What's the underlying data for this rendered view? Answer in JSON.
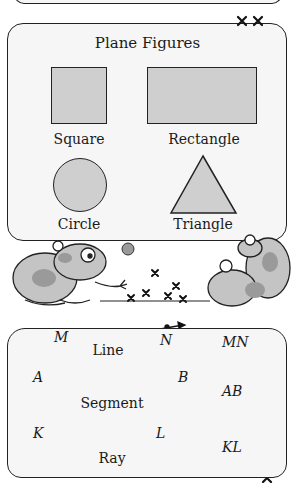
{
  "panel_top": {
    "title": "Plane Figures",
    "figures": [
      {
        "name": "square",
        "label": "Square"
      },
      {
        "name": "rectangle",
        "label": "Rectangle"
      },
      {
        "name": "circle",
        "label": "Circle"
      },
      {
        "name": "triangle",
        "label": "Triangle"
      }
    ]
  },
  "panel_bottom": {
    "rows": [
      {
        "kind": "line",
        "label": "Line",
        "point1": "M",
        "point2": "N",
        "notation": "MN",
        "symbol": "double-arrow"
      },
      {
        "kind": "segment",
        "label": "Segment",
        "point1": "A",
        "point2": "B",
        "notation": "AB",
        "symbol": "bar"
      },
      {
        "kind": "ray",
        "label": "Ray",
        "point1": "K",
        "point2": "L",
        "notation": "KL",
        "symbol": "single-arrow"
      }
    ]
  },
  "colors": {
    "panel_fill": "#f6f6f6",
    "shape_fill": "#cfcfcf",
    "outline": "#222222",
    "frog_fill": "#c4c4c4",
    "frog_spots": "#9a9a9a"
  },
  "illustration": {
    "description": "two pairs of cartoon frogs playing jacks between the panels"
  }
}
